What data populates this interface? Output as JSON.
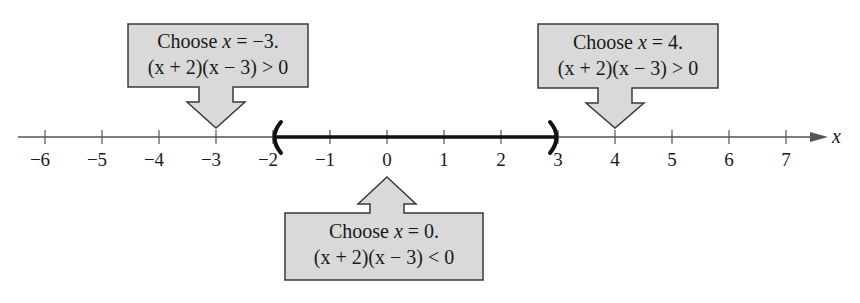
{
  "diagram": {
    "type": "number-line-test-intervals",
    "axis": {
      "variable": "x",
      "min": -6,
      "max": 7,
      "ticks": [
        "−6",
        "−5",
        "−4",
        "−3",
        "−2",
        "−1",
        "0",
        "1",
        "2",
        "3",
        "4",
        "5",
        "6",
        "7"
      ],
      "tick_values": [
        -6,
        -5,
        -4,
        -3,
        -2,
        -1,
        0,
        1,
        2,
        3,
        4,
        5,
        6,
        7
      ]
    },
    "highlighted_interval": {
      "left": -2,
      "right": 3,
      "left_endpoint": "open",
      "right_endpoint": "open"
    },
    "callouts": [
      {
        "position": "above",
        "test_value": -3,
        "line1_prefix": "Choose ",
        "line1_var": "x",
        "line1_suffix": " = −3.",
        "line2": "(x + 2)(x − 3) > 0"
      },
      {
        "position": "below",
        "test_value": 0,
        "line1_prefix": "Choose ",
        "line1_var": "x",
        "line1_suffix": " = 0.",
        "line2": "(x + 2)(x − 3) < 0"
      },
      {
        "position": "above",
        "test_value": 4,
        "line1_prefix": "Choose ",
        "line1_var": "x",
        "line1_suffix": " = 4.",
        "line2": "(x + 2)(x − 3) > 0"
      }
    ],
    "colors": {
      "callout_fill": "#d9d9d9",
      "callout_stroke": "#3a3a3a",
      "axis": "#555555",
      "interval": "#111111"
    }
  }
}
